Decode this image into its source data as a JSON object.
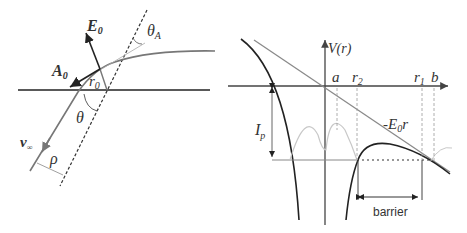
{
  "left_panel": {
    "labels": {
      "E0": "E",
      "E0_sub": "0",
      "A0": "A",
      "A0_sub": "0",
      "r0": "r",
      "r0_sub": "0",
      "theta": "θ",
      "thetaA": "θ",
      "thetaA_sub": "A",
      "v_inf": "v",
      "v_inf_sub": "∞",
      "rho": "ρ"
    }
  },
  "right_panel": {
    "labels": {
      "V_r": "V(r)",
      "a": "a",
      "r2": "r",
      "r2_sub": "2",
      "r1": "r",
      "r1_sub": "1",
      "b": "b",
      "Ip": "I",
      "Ip_sub": "p",
      "field": "-E",
      "field_sub": "0",
      "field_tail": "r",
      "barrier": "barrier"
    }
  },
  "colors": {
    "dark_line": "#222222",
    "gray_line": "#8a8a8a",
    "light_curve": "#c8c8c8",
    "dashed": "#999999"
  }
}
